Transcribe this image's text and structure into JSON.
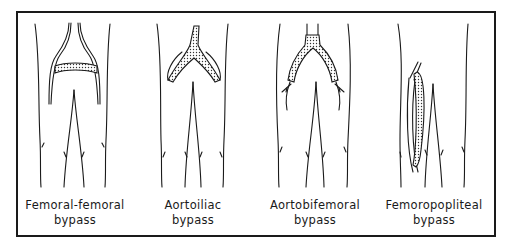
{
  "figure": {
    "panels": [
      {
        "id": "femoral-femoral",
        "line1": "Femoral-femoral",
        "line2": "bypass"
      },
      {
        "id": "aortoiliac",
        "line1": "Aortoiliac",
        "line2": "bypass"
      },
      {
        "id": "aortobifemoral",
        "line1": "Aortobifemoral",
        "line2": "bypass"
      },
      {
        "id": "femoropopliteal",
        "line1": "Femoropopliteal",
        "line2": "bypass"
      }
    ],
    "colors": {
      "ink": "#1a1a1a",
      "background": "#ffffff"
    }
  }
}
